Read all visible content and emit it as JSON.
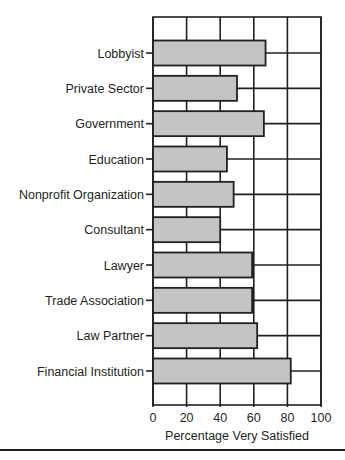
{
  "chart_data": {
    "type": "bar",
    "orientation": "horizontal",
    "title": "",
    "xlabel": "Percentage Very Satisfied",
    "ylabel": "",
    "categories": [
      "Lobbyist",
      "Private Sector",
      "Government",
      "Education",
      "Nonprofit Organization",
      "Consultant",
      "Lawyer",
      "Trade Association",
      "Law Partner",
      "Financial Institution"
    ],
    "values": [
      67,
      50,
      66,
      44,
      48,
      40,
      59,
      59,
      62,
      82
    ],
    "xlim": [
      0,
      100
    ],
    "xticks": [
      0,
      20,
      40,
      60,
      80,
      100
    ],
    "grid": true,
    "legend": null,
    "colors": {
      "bar_fill": "#c4c4c4",
      "bar_stroke": "#231f20",
      "grid": "#231f20"
    }
  }
}
